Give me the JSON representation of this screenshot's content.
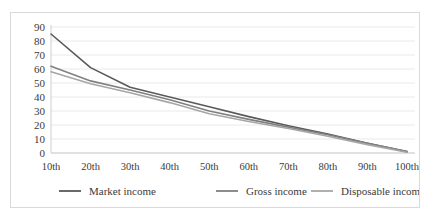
{
  "chart_data": {
    "type": "line",
    "title": "",
    "subtitle": "",
    "xlabel": "",
    "ylabel": "",
    "x": [
      "10th",
      "20th",
      "30th",
      "40th",
      "50th",
      "60th",
      "70th",
      "80th",
      "90th",
      "100th"
    ],
    "categories": [
      "10th",
      "20th",
      "30th",
      "40th",
      "50th",
      "60th",
      "70th",
      "80th",
      "90th",
      "100th"
    ],
    "ylim": [
      0,
      90
    ],
    "xlim": [
      0,
      9
    ],
    "yticks": [
      0,
      10,
      20,
      30,
      40,
      50,
      60,
      70,
      80,
      90
    ],
    "ytick_labels": [
      "0",
      "10",
      "20",
      "30",
      "40",
      "50",
      "60",
      "70",
      "80",
      "90"
    ],
    "grid": true,
    "grid_axis": "y",
    "legend_position": "bottom",
    "series": [
      {
        "name": "Market income",
        "color": "#595959",
        "values": [
          85,
          61,
          47,
          40,
          33,
          26,
          19.5,
          13.5,
          7,
          1
        ]
      },
      {
        "name": "Gross income",
        "color": "#808080",
        "values": [
          62,
          51.5,
          45,
          38,
          30,
          24,
          18.5,
          13,
          7,
          1
        ]
      },
      {
        "name": "Disposable income",
        "color": "#a6a6a6",
        "values": [
          58,
          49.5,
          43,
          36,
          28,
          22.5,
          17.5,
          12,
          6,
          0.5
        ]
      }
    ],
    "legend": [
      {
        "label": "Market income",
        "color": "#595959"
      },
      {
        "label": "Gross income",
        "color": "#808080"
      },
      {
        "label": "Disposable income",
        "color": "#a6a6a6"
      }
    ]
  },
  "colors": {
    "background": "#ffffff",
    "frame_border": "#d9d9d9",
    "gridline": "#e4e4e4",
    "axis": "#c9c9c9",
    "text": "#3a3a3a"
  }
}
